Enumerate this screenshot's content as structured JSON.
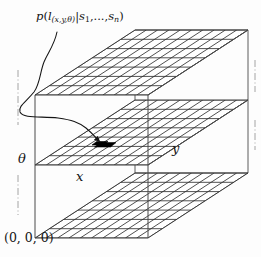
{
  "figure": {
    "title_label": "p(l(x,y,θ)|s1,...,sn)",
    "origin_label": "(0, 0, 0)",
    "axis_labels": {
      "vertical": "θ",
      "horizontal": "x",
      "depth": "y"
    },
    "posterior_label_parts": {
      "p": "p",
      "open_paren": "(",
      "l": "l",
      "l_subscript": "(x,y,θ)",
      "bar": "|",
      "s": "s",
      "s_sub1": "1",
      "ellipsis": ",...,",
      "s2": "s",
      "s_subn": "n",
      "close_paren": ")"
    },
    "origin_parts": {
      "open_paren": "(",
      "zero1": "0",
      "comma1": ", ",
      "zero2": "0",
      "comma2": ", ",
      "zero3": "0",
      "close_paren": ")"
    },
    "plane_count": 3,
    "highlighted_cell": "black-filled grid cell on middle plane",
    "colors": {
      "ink": "#141414",
      "grid_line": "#2b2b2b",
      "box_edge": "#3a3a3a",
      "highlight_fill": "#000000",
      "background": "#fdfdfd"
    },
    "grid": {
      "columns": 10,
      "rows": 7
    }
  }
}
